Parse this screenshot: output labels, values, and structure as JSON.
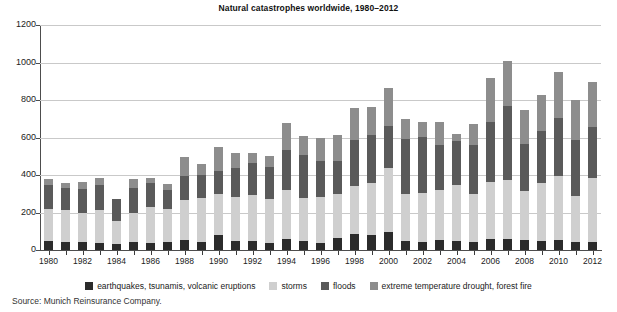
{
  "chart_data": {
    "type": "bar",
    "stacked": true,
    "title": "Natural catastrophes worldwide, 1980–2012",
    "xlabel": "",
    "ylabel": "",
    "ylim": [
      0,
      1200
    ],
    "yticks": [
      0,
      200,
      400,
      600,
      800,
      1000,
      1200
    ],
    "ytick_labels": [
      "0",
      "200",
      "400",
      "600",
      "800",
      "1000",
      "1200"
    ],
    "grid": true,
    "legend_position": "bottom",
    "categories": [
      "1980",
      "1981",
      "1982",
      "1983",
      "1984",
      "1985",
      "1986",
      "1987",
      "1988",
      "1989",
      "1990",
      "1991",
      "1992",
      "1993",
      "1994",
      "1995",
      "1996",
      "1997",
      "1998",
      "1999",
      "2000",
      "2001",
      "2002",
      "2003",
      "2004",
      "2005",
      "2006",
      "2007",
      "2008",
      "2009",
      "2010",
      "2011",
      "2012"
    ],
    "xtick_labels": [
      "1980",
      "1982",
      "1984",
      "1986",
      "1988",
      "1990",
      "1992",
      "1994",
      "1996",
      "1998",
      "2000",
      "2002",
      "2004",
      "2006",
      "2008",
      "2010",
      "2012"
    ],
    "series": [
      {
        "name": "earthquakes, tsunamis, volcanic eruptions",
        "color": "#2b2b2b",
        "values": [
          50,
          45,
          45,
          40,
          30,
          45,
          40,
          45,
          55,
          45,
          80,
          50,
          50,
          40,
          60,
          50,
          40,
          65,
          85,
          80,
          95,
          50,
          45,
          55,
          50,
          45,
          60,
          60,
          55,
          50,
          55,
          45,
          45
        ]
      },
      {
        "name": "storms",
        "color": "#cfcfcf",
        "values": [
          170,
          170,
          155,
          175,
          125,
          155,
          190,
          175,
          210,
          230,
          220,
          235,
          245,
          230,
          260,
          225,
          245,
          235,
          255,
          280,
          345,
          250,
          260,
          265,
          295,
          255,
          305,
          315,
          260,
          310,
          340,
          245,
          340
        ]
      },
      {
        "name": "floods",
        "color": "#5a5a5a",
        "values": [
          125,
          115,
          125,
          130,
          115,
          130,
          125,
          100,
          130,
          125,
          120,
          150,
          170,
          175,
          215,
          230,
          190,
          175,
          245,
          255,
          220,
          290,
          300,
          240,
          235,
          260,
          320,
          395,
          250,
          275,
          310,
          295,
          270
        ]
      },
      {
        "name": "extreme temperature drought, forest fire",
        "color": "#8d8d8d",
        "values": [
          35,
          30,
          40,
          40,
          0,
          50,
          30,
          30,
          100,
          60,
          130,
          80,
          55,
          55,
          140,
          105,
          125,
          140,
          175,
          150,
          205,
          110,
          80,
          125,
          40,
          110,
          235,
          240,
          180,
          190,
          245,
          215,
          240
        ]
      }
    ],
    "totals": [
      380,
      360,
      365,
      385,
      270,
      380,
      385,
      350,
      495,
      460,
      550,
      515,
      520,
      500,
      675,
      610,
      600,
      615,
      760,
      765,
      865,
      700,
      685,
      685,
      620,
      670,
      920,
      1010,
      745,
      825,
      950,
      800,
      895
    ],
    "source": "Source: Munich Reinsurance Company."
  },
  "legend": {
    "items": [
      {
        "label": "earthquakes, tsunamis, volcanic eruptions",
        "color": "#2b2b2b"
      },
      {
        "label": "storms",
        "color": "#cfcfcf"
      },
      {
        "label": "floods",
        "color": "#5a5a5a"
      },
      {
        "label": "extreme temperature drought, forest fire",
        "color": "#8d8d8d"
      }
    ]
  }
}
